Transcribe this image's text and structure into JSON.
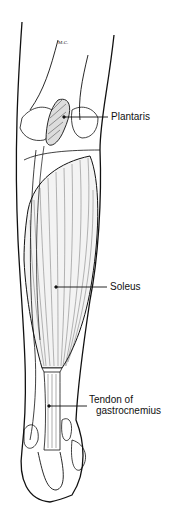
{
  "diagram": {
    "signature": "M.C.",
    "labels": [
      {
        "id": "plantaris",
        "text": "Plantaris",
        "x": 111,
        "y": 111,
        "pointer": [
          64,
          117,
          108,
          117
        ]
      },
      {
        "id": "soleus",
        "text": "Soleus",
        "x": 110,
        "y": 281,
        "pointer": [
          56,
          287,
          107,
          287
        ]
      },
      {
        "id": "tendon",
        "line1": "Tendon of",
        "line2": "gastrocnemius",
        "x": 89,
        "y": 394,
        "pointer": [
          49,
          406,
          87,
          406
        ]
      }
    ],
    "colors": {
      "ink": "#111111",
      "background": "#ffffff"
    }
  }
}
